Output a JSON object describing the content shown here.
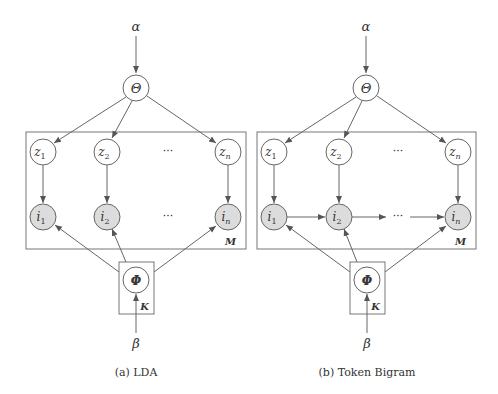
{
  "figure": {
    "panels": [
      {
        "id": "lda",
        "caption": "(a) LDA",
        "alpha": "α",
        "theta": "Θ",
        "phi": "Φ",
        "beta": "β",
        "plate_outer": "M",
        "plate_inner": "K",
        "z_nodes": [
          "z",
          "z",
          "z"
        ],
        "z_subs": [
          "1",
          "2",
          "n"
        ],
        "i_nodes": [
          "i",
          "i",
          "i"
        ],
        "i_subs": [
          "1",
          "2",
          "n"
        ],
        "ellipsis": "···",
        "bigram_edges": false
      },
      {
        "id": "token-bigram",
        "caption": "(b) Token Bigram",
        "alpha": "α",
        "theta": "Θ",
        "phi": "Φ",
        "beta": "β",
        "plate_outer": "M",
        "plate_inner": "K",
        "z_nodes": [
          "z",
          "z",
          "z"
        ],
        "z_subs": [
          "1",
          "2",
          "n"
        ],
        "i_nodes": [
          "i",
          "i",
          "i"
        ],
        "i_subs": [
          "1",
          "2",
          "n"
        ],
        "ellipsis": "···",
        "bigram_edges": true
      }
    ],
    "colors": {
      "stroke": "#666666",
      "observed_fill": "#dcdcdc",
      "latent_fill": "#ffffff",
      "text": "#333333"
    }
  }
}
